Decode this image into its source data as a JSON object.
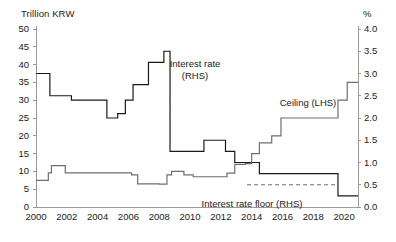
{
  "axes": {
    "left_unit": "Trillion KRW",
    "right_unit": "%",
    "left_ticks": [
      "0",
      "5",
      "10",
      "15",
      "20",
      "25",
      "30",
      "35",
      "40",
      "45",
      "50"
    ],
    "right_ticks": [
      "0.0",
      "0.5",
      "1.0",
      "1.5",
      "2.0",
      "2.5",
      "3.0",
      "3.5",
      "4.0"
    ],
    "x_ticks": [
      "2000",
      "2002",
      "2004",
      "2006",
      "2008",
      "2010",
      "2012",
      "2014",
      "2016",
      "2018",
      "2020"
    ]
  },
  "labels": {
    "interest_rate_line1": "Interest rate",
    "interest_rate_line2": "(RHS)",
    "ceiling": "Ceiling (LHS)",
    "floor": "Interest rate floor (RHS)"
  },
  "colors": {
    "axis": "#9a9a9a",
    "interest_rate": "#1a1a1a",
    "ceiling": "#6e6e6e",
    "floor": "#6e6e6e",
    "text": "#1a1a1a"
  },
  "chart_data": {
    "type": "line",
    "title": "",
    "subtitle": "",
    "xlabel": "",
    "ylabel": "Trillion KRW",
    "y2label": "%",
    "xlim": [
      2000,
      2020.9
    ],
    "ylim": [
      0,
      50
    ],
    "y2lim": [
      0.0,
      4.0
    ],
    "grid": false,
    "legend": "inline-annotations",
    "series": [
      {
        "name": "Interest rate (RHS)",
        "axis": "right",
        "units": "%",
        "style": "solid",
        "color": "#1a1a1a",
        "step": true,
        "points": [
          [
            2000.0,
            3.0
          ],
          [
            2000.9,
            3.0
          ],
          [
            2000.9,
            2.5
          ],
          [
            2002.3,
            2.5
          ],
          [
            2002.3,
            2.4
          ],
          [
            2004.6,
            2.4
          ],
          [
            2004.6,
            2.0
          ],
          [
            2005.3,
            2.0
          ],
          [
            2005.3,
            2.1
          ],
          [
            2005.8,
            2.1
          ],
          [
            2005.8,
            2.4
          ],
          [
            2006.3,
            2.4
          ],
          [
            2006.3,
            2.75
          ],
          [
            2007.3,
            2.75
          ],
          [
            2007.3,
            3.25
          ],
          [
            2008.3,
            3.25
          ],
          [
            2008.3,
            3.5
          ],
          [
            2008.7,
            3.5
          ],
          [
            2008.7,
            1.25
          ],
          [
            2010.9,
            1.25
          ],
          [
            2010.9,
            1.5
          ],
          [
            2012.3,
            1.5
          ],
          [
            2012.3,
            1.25
          ],
          [
            2012.9,
            1.25
          ],
          [
            2012.9,
            1.0
          ],
          [
            2014.5,
            1.0
          ],
          [
            2014.5,
            0.75
          ],
          [
            2019.6,
            0.75
          ],
          [
            2019.6,
            0.25
          ],
          [
            2020.9,
            0.25
          ]
        ]
      },
      {
        "name": "Ceiling (LHS)",
        "axis": "left",
        "units": "Trillion KRW",
        "style": "solid",
        "color": "#6e6e6e",
        "step": true,
        "points": [
          [
            2000.0,
            7.5
          ],
          [
            2000.8,
            7.5
          ],
          [
            2000.8,
            9.6
          ],
          [
            2001.0,
            9.6
          ],
          [
            2001.0,
            11.6
          ],
          [
            2001.9,
            11.6
          ],
          [
            2001.9,
            9.6
          ],
          [
            2006.2,
            9.6
          ],
          [
            2006.2,
            9.0
          ],
          [
            2006.6,
            9.0
          ],
          [
            2006.6,
            6.5
          ],
          [
            2008.0,
            6.5
          ],
          [
            2008.0,
            6.4
          ],
          [
            2008.5,
            6.4
          ],
          [
            2008.5,
            9.0
          ],
          [
            2008.8,
            9.0
          ],
          [
            2008.8,
            10.0
          ],
          [
            2009.6,
            10.0
          ],
          [
            2009.6,
            9.0
          ],
          [
            2010.2,
            9.0
          ],
          [
            2010.2,
            8.5
          ],
          [
            2012.4,
            8.5
          ],
          [
            2012.4,
            9.5
          ],
          [
            2012.9,
            9.5
          ],
          [
            2012.9,
            12.0
          ],
          [
            2013.6,
            12.0
          ],
          [
            2013.6,
            12.2
          ],
          [
            2014.0,
            12.2
          ],
          [
            2014.0,
            15.0
          ],
          [
            2014.5,
            15.0
          ],
          [
            2014.5,
            18.0
          ],
          [
            2015.3,
            18.0
          ],
          [
            2015.3,
            20.0
          ],
          [
            2015.9,
            20.0
          ],
          [
            2015.9,
            25.0
          ],
          [
            2019.6,
            25.0
          ],
          [
            2019.6,
            30.0
          ],
          [
            2020.2,
            30.0
          ],
          [
            2020.2,
            35.0
          ],
          [
            2020.9,
            35.0
          ]
        ]
      },
      {
        "name": "Interest rate floor (RHS)",
        "axis": "right",
        "units": "%",
        "style": "dashed",
        "color": "#6e6e6e",
        "step": true,
        "points": [
          [
            2013.7,
            0.5
          ],
          [
            2019.6,
            0.5
          ]
        ]
      }
    ]
  }
}
